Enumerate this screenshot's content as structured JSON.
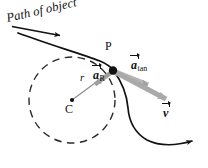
{
  "figure": {
    "background_color": "#ffffff",
    "width": 208,
    "height": 168,
    "labels": {
      "path_of_object": "Path of object",
      "point_P": "P",
      "center_C": "C",
      "radius": "r",
      "radial_acceleration_symbol": "a",
      "radial_acceleration_subscript": "R",
      "tangential_acceleration_symbol": "a",
      "tangential_acceleration_subscript": "tan",
      "velocity_symbol": "v",
      "velocity_subscript": ""
    },
    "colors": {
      "ink": "#111111",
      "dashed_circle": "#2b2b2b",
      "gray_vector": "#a9a9a9",
      "gray_vector_light": "#bcbcbc",
      "radius_line": "#8a8a8a"
    },
    "geometry": {
      "center_x": 72,
      "center_y": 100,
      "radius": 43,
      "point_p_x": 113,
      "point_p_y": 70,
      "velocity_tip_x": 171,
      "velocity_tip_y": 101,
      "atan_tip_x": 151,
      "atan_tip_y": 83
    }
  }
}
